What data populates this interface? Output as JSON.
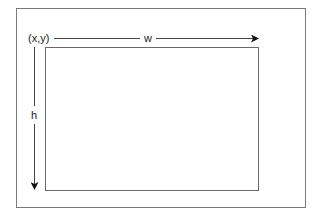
{
  "diagram": {
    "labels": {
      "origin": "(x,y)",
      "width": "w",
      "height": "h"
    },
    "colors": {
      "background": "#ffffff",
      "outer_border": "#7a7a7a",
      "inner_border": "#6a6a6a",
      "arrow": "#444444",
      "arrowhead": "#111111",
      "text": "#222222"
    },
    "shapes": {
      "outer_frame": {
        "x": 16,
        "y": 8,
        "w": 289,
        "h": 199
      },
      "inner_rect": {
        "x": 45,
        "y": 47,
        "w": 213,
        "h": 143
      }
    }
  }
}
